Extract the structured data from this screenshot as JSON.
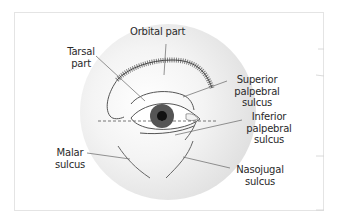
{
  "figure": {
    "labels": {
      "orbital_part": "Orbital part",
      "tarsal_part_line1": "Tarsal",
      "tarsal_part_line2": "part",
      "superior_line1": "Superior",
      "superior_line2": "palpebral",
      "superior_line3": "sulcus",
      "inferior_line1": "Inferior",
      "inferior_line2": "palpebral",
      "inferior_line3": "sulcus",
      "malar_line1": "Malar",
      "malar_line2": "sulcus",
      "nasojugal_line1": "Nasojugal",
      "nasojugal_line2": "sulcus"
    },
    "colors": {
      "background": "#ffffff",
      "frame": "#e4e4e4",
      "circle_fill": "#e6e6e6",
      "iris": "#555555",
      "pupil": "#111111",
      "line": "#555555",
      "text": "#2a2a2a"
    }
  }
}
